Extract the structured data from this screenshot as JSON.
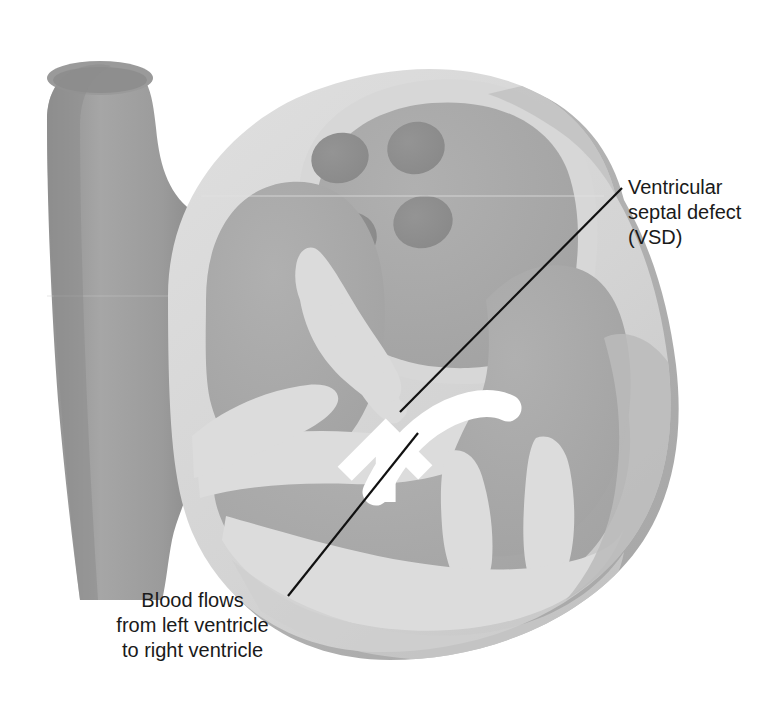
{
  "figure": {
    "kind": "anatomical-illustration",
    "background_color": "#ffffff"
  },
  "palette": {
    "chamber_fill": "#a9a9a9",
    "chamber_fill_dark": "#9a9a9a",
    "myocardium": "#d2d2d2",
    "myocardium_light": "#dcdcdc",
    "outer_rim": "#b4b4b4",
    "vessel": "#a0a0a0",
    "vessel_lumen": "#959595",
    "vein_opening": "#8e8e8e",
    "arrow": "#ffffff",
    "leader_line": "#111111",
    "text": "#1a1a1a"
  },
  "labels": {
    "vsd": {
      "lines": [
        "Ventricular",
        "septal defect",
        "(VSD)"
      ],
      "text": "Ventricular\nseptal defect\n(VSD)",
      "align": "left"
    },
    "flow": {
      "lines": [
        "Blood flows",
        "from left ventricle",
        "to right ventricle"
      ],
      "text": "Blood flows\nfrom left ventricle\nto right ventricle",
      "align": "center"
    }
  },
  "leader_lines": [
    {
      "name": "vsd-leader",
      "from": [
        622,
        188
      ],
      "to": [
        400,
        412
      ]
    },
    {
      "name": "flow-leader",
      "from": [
        288,
        596
      ],
      "to": [
        418,
        433
      ]
    }
  ],
  "annotations": {
    "arrow_name": "blood-flow-arrow",
    "arrow_direction": "right-to-left, curving downward through septal defect"
  },
  "structures": [
    {
      "name": "superior-vena-cava",
      "type": "vessel"
    },
    {
      "name": "right-atrium",
      "type": "chamber"
    },
    {
      "name": "left-atrium",
      "type": "chamber"
    },
    {
      "name": "pulmonary-vein-openings",
      "type": "openings",
      "count": 4
    },
    {
      "name": "interventricular-septum",
      "type": "wall"
    },
    {
      "name": "ventricular-septal-defect",
      "type": "defect"
    },
    {
      "name": "right-ventricle",
      "type": "chamber"
    },
    {
      "name": "left-ventricle",
      "type": "chamber"
    },
    {
      "name": "papillary-muscles",
      "type": "muscle"
    },
    {
      "name": "myocardium",
      "type": "wall"
    }
  ]
}
